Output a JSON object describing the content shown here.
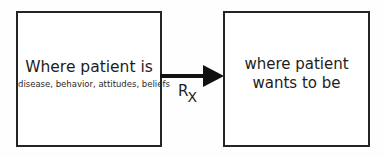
{
  "diagram": {
    "type": "flow",
    "background_color": "#fefefe",
    "stroke_color": "#242424",
    "arrow_color": "#111111",
    "text_color": "#1d1d1d",
    "nodes": [
      {
        "id": "current-state",
        "title": "Where patient is",
        "subtitle": "disease, behavior, attitudes, beliefs"
      },
      {
        "id": "goal-state",
        "line1": "where patient",
        "line2": "wants to be"
      }
    ],
    "connector": {
      "id": "rx-arrow",
      "direction": "right",
      "label_main": "R",
      "label_sub": "X",
      "label_full": "Rx"
    }
  }
}
